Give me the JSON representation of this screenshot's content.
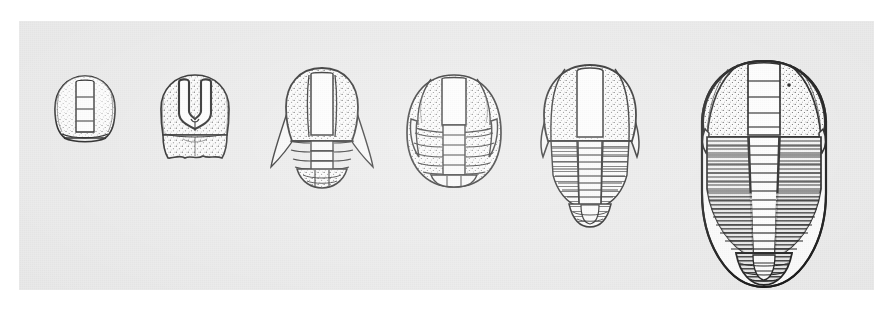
{
  "figure": {
    "kind": "scientific-illustration",
    "caption": "",
    "plate": {
      "background_color": "#e9e9e9",
      "page_color": "#ffffff",
      "ink_color": "#1a1a1a",
      "shell_fill": "#fbfbfb",
      "x": 19,
      "y": 21,
      "width": 855,
      "height": 269
    },
    "specimen_count": 6,
    "arrangement": "left-to-right, increasing size, baseline-aligned near top of plate"
  },
  "specimens": [
    {
      "index": 1,
      "name": "protaspis-stage-1",
      "stage_label": "protaspid",
      "cx": 66,
      "cy": 95,
      "width": 62,
      "height": 64,
      "thoracic_segments": 0,
      "glabellar_furrows": 3,
      "genal_spines": false,
      "description": "small sub-circular cephalic shield with narrow raised glabella and posterior rim"
    },
    {
      "index": 2,
      "name": "protaspis-stage-2",
      "stage_label": "protaspid",
      "cx": 176,
      "cy": 98,
      "width": 74,
      "height": 86,
      "thoracic_segments": 0,
      "glabellar_furrows": 3,
      "genal_spines": false,
      "description": "bell-shaped shield, dark U-shaped glabella outline, separate transitory pygidial band"
    },
    {
      "index": 3,
      "name": "meraspis-stage-1",
      "stage_label": "meraspid",
      "cx": 305,
      "cy": 105,
      "width": 92,
      "height": 112,
      "thoracic_segments": 3,
      "glabellar_furrows": 3,
      "genal_spines": true,
      "description": "cephalon with outward-flaring genal spines, three thoracic rings, rounded pygidium"
    },
    {
      "index": 4,
      "name": "meraspis-stage-2",
      "stage_label": "meraspid",
      "cx": 436,
      "cy": 108,
      "width": 94,
      "height": 116,
      "thoracic_segments": 5,
      "glabellar_furrows": 3,
      "genal_spines": true,
      "description": "oval outline, five thoracic segments with pleural furrows, short genal spines"
    },
    {
      "index": 5,
      "name": "meraspis-stage-3",
      "stage_label": "late meraspid",
      "cx": 571,
      "cy": 120,
      "width": 104,
      "height": 146,
      "thoracic_segments": 9,
      "glabellar_furrows": 3,
      "genal_spines": true,
      "description": "broad cephalon with long genal spines, nine thoracic segments, tapering pygidium"
    },
    {
      "index": 6,
      "name": "holaspis-adult",
      "stage_label": "holaspid (adult)",
      "cx": 742,
      "cy": 163,
      "width": 124,
      "height": 235,
      "thoracic_segments": 14,
      "glabellar_furrows": 4,
      "genal_spines": true,
      "description": "large elongate adult; cephalon with facial sutures, fourteen thoracic segments, hatched pleural lobes, rounded pygidium"
    }
  ]
}
